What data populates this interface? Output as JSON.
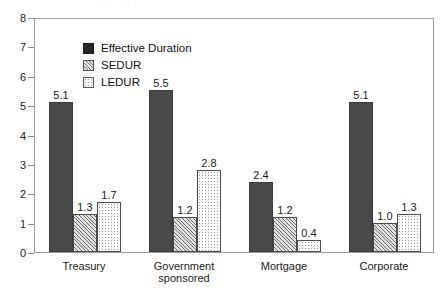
{
  "figure": {
    "title_faint": "· ·   ·      · · ·",
    "background_color": "#ffffff",
    "frame_color": "#9a9a9a"
  },
  "legend": {
    "position": "top-left-inside",
    "items": [
      {
        "label": "Effective Duration",
        "swatch": "solid-dark-square-icon",
        "color": "#494949"
      },
      {
        "label": "SEDUR",
        "swatch": "hatched-square-icon",
        "color": "#e2e2e2"
      },
      {
        "label": "LEDUR",
        "swatch": "dotted-square-icon",
        "color": "#fbfbfb"
      }
    ]
  },
  "axes": {
    "y_ticks": [
      "8",
      "7",
      "6",
      "5",
      "4",
      "3",
      "2",
      "1",
      "0"
    ],
    "x_categories": [
      "Treasury",
      "Government\nsponsored",
      "Mortgage",
      "Corporate"
    ]
  },
  "chart_data": {
    "type": "bar",
    "title": "",
    "subtitle": "",
    "xlabel": "",
    "ylabel": "",
    "ylim": [
      0,
      8
    ],
    "y_ticks": [
      0,
      1,
      2,
      3,
      4,
      5,
      6,
      7,
      8
    ],
    "grid": false,
    "legend_position": "upper left",
    "categories": [
      "Treasury",
      "Government sponsored",
      "Mortgage",
      "Corporate"
    ],
    "series": [
      {
        "name": "Effective Duration",
        "values": [
          5.1,
          5.5,
          2.4,
          5.1
        ],
        "labels": [
          "5.1",
          "5.5",
          "2.4",
          "5.1"
        ],
        "color": "#494949",
        "pattern": "solid"
      },
      {
        "name": "SEDUR",
        "values": [
          1.3,
          1.2,
          1.2,
          1.0
        ],
        "labels": [
          "1.3",
          "1.2",
          "1.2",
          "1.0"
        ],
        "color": "#e2e2e2",
        "pattern": "diagonal-hatch"
      },
      {
        "name": "LEDUR",
        "values": [
          1.7,
          2.8,
          0.4,
          1.3
        ],
        "labels": [
          "1.7",
          "2.8",
          "0.4",
          "1.3"
        ],
        "color": "#fbfbfb",
        "pattern": "dotted"
      }
    ]
  }
}
